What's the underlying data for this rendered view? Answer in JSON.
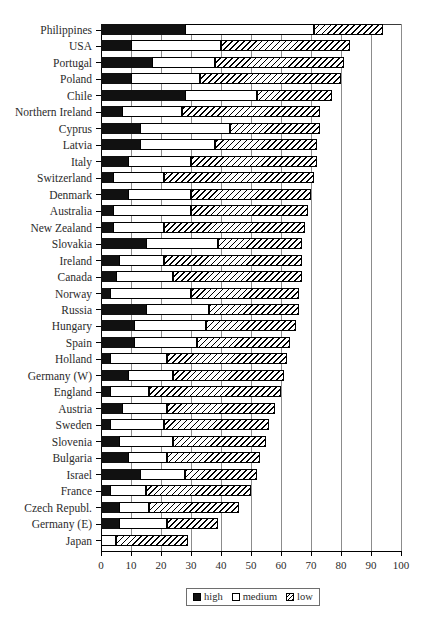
{
  "chart_data": {
    "type": "bar",
    "orientation": "horizontal",
    "stacked": true,
    "title": "",
    "xlabel": "",
    "ylabel": "",
    "xlim": [
      0,
      100
    ],
    "xticks": [
      0,
      10,
      20,
      30,
      40,
      50,
      60,
      70,
      80,
      90,
      100
    ],
    "grid": "vertical",
    "legend": {
      "position": "bottom",
      "entries": [
        {
          "label": "high",
          "key": "high",
          "fill": "solid-black",
          "color": "#111111"
        },
        {
          "label": "medium",
          "key": "medium",
          "fill": "white",
          "color": "#ffffff"
        },
        {
          "label": "low",
          "key": "low",
          "fill": "diagonal-hatch",
          "color": "#ffffff"
        }
      ]
    },
    "categories": [
      "Philippines",
      "USA",
      "Portugal",
      "Poland",
      "Chile",
      "Northern Ireland",
      "Cyprus",
      "Latvia",
      "Italy",
      "Switzerland",
      "Denmark",
      "Australia",
      "New Zealand",
      "Slovakia",
      "Ireland",
      "Canada",
      "Norway",
      "Russia",
      "Hungary",
      "Spain",
      "Holland",
      "Germany (W)",
      "England",
      "Austria",
      "Sweden",
      "Slovenia",
      "Bulgaria",
      "Israel",
      "France",
      "Czech Republ.",
      "Germany (E)",
      "Japan"
    ],
    "series": [
      {
        "name": "high",
        "values": [
          28,
          10,
          17,
          10,
          28,
          7,
          13,
          13,
          9,
          4,
          9,
          4,
          4,
          15,
          6,
          5,
          3,
          15,
          11,
          11,
          3,
          9,
          3,
          7,
          3,
          6,
          9,
          13,
          3,
          6,
          6,
          0
        ]
      },
      {
        "name": "medium",
        "values": [
          43,
          30,
          21,
          23,
          24,
          20,
          30,
          25,
          21,
          17,
          21,
          26,
          17,
          24,
          15,
          19,
          27,
          21,
          24,
          21,
          19,
          15,
          13,
          15,
          18,
          18,
          13,
          15,
          12,
          10,
          16,
          5
        ]
      },
      {
        "name": "low",
        "values": [
          23,
          43,
          43,
          47,
          25,
          46,
          30,
          34,
          42,
          50,
          40,
          39,
          47,
          28,
          46,
          43,
          36,
          30,
          30,
          31,
          40,
          37,
          44,
          36,
          35,
          31,
          31,
          24,
          35,
          30,
          17,
          24
        ]
      }
    ],
    "totals": [
      94,
      83,
      81,
      80,
      77,
      73,
      73,
      72,
      72,
      71,
      70,
      69,
      68,
      67,
      67,
      67,
      66,
      66,
      65,
      63,
      62,
      61,
      60,
      58,
      56,
      55,
      53,
      52,
      50,
      46,
      39,
      29
    ]
  }
}
